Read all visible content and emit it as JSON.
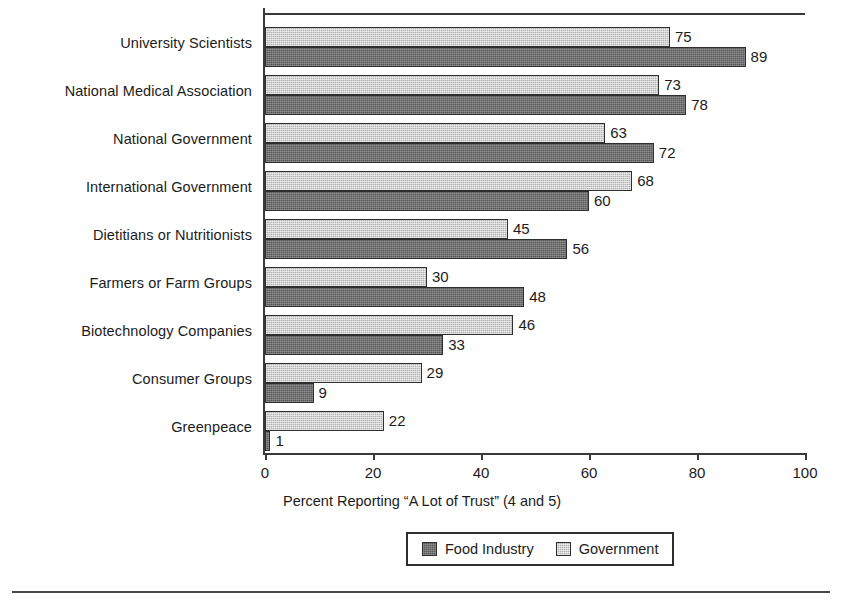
{
  "chart_data": {
    "type": "bar",
    "orientation": "horizontal",
    "title": "",
    "xlabel": "Percent Reporting “A Lot of Trust” (4 and 5)",
    "ylabel": "",
    "xlim": [
      0,
      100
    ],
    "xticks": [
      0,
      20,
      40,
      60,
      80,
      100
    ],
    "xtick_labels": [
      "0",
      "20",
      "40",
      "60",
      "80",
      "100"
    ],
    "grid": false,
    "legend_position": "bottom-center",
    "categories": [
      "University Scientists",
      "National Medical Association",
      "National Government",
      "International Government",
      "Dietitians or Nutritionists",
      "Farmers or Farm Groups",
      "Biotechnology Companies",
      "Consumer Groups",
      "Greenpeace"
    ],
    "series": [
      {
        "name": "Government",
        "color": "#b0b0b0",
        "values": [
          75,
          73,
          63,
          68,
          45,
          30,
          46,
          29,
          22
        ]
      },
      {
        "name": "Food Industry",
        "color": "#585858",
        "values": [
          89,
          78,
          72,
          60,
          56,
          48,
          33,
          9,
          1
        ]
      }
    ]
  },
  "legend": {
    "items": [
      {
        "label": "Food Industry",
        "color": "#585858"
      },
      {
        "label": "Government",
        "color": "#b0b0b0"
      }
    ]
  },
  "axis": {
    "x_title": "Percent Reporting “A Lot of Trust” (4 and 5)",
    "tick_labels": [
      "0",
      "20",
      "40",
      "60",
      "80",
      "100"
    ]
  }
}
